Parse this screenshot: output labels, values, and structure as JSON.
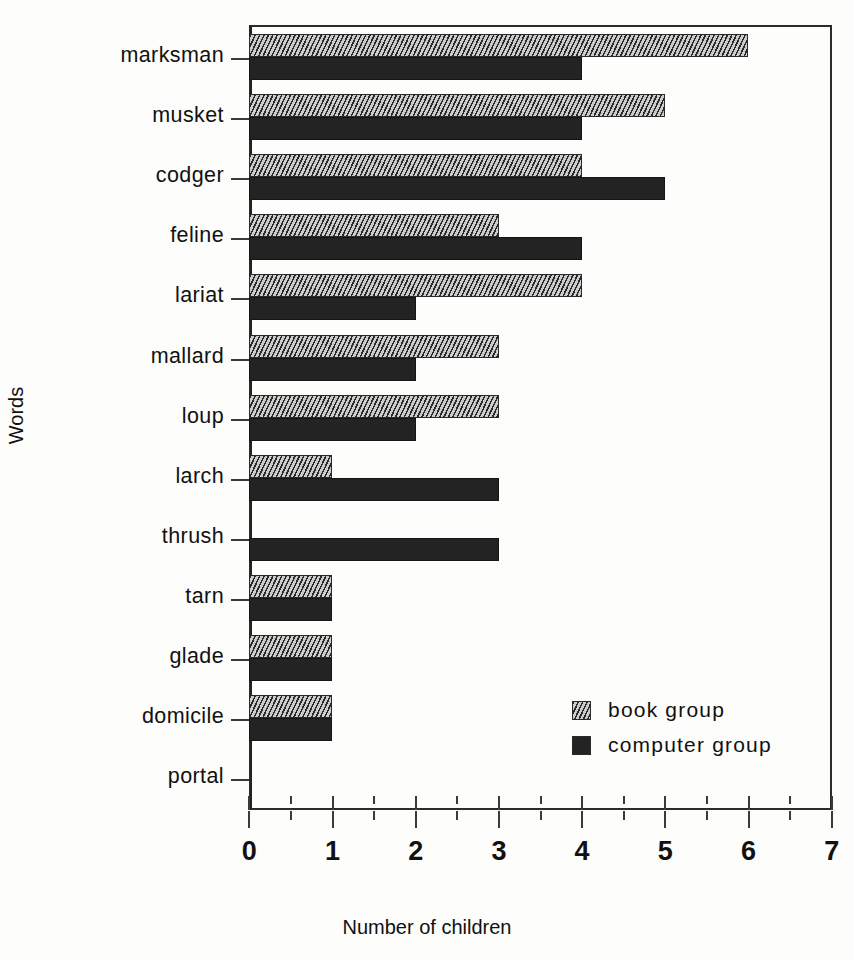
{
  "chart_data": {
    "type": "bar",
    "orientation": "horizontal",
    "title": "",
    "xlabel": "Number of children",
    "ylabel": "Words",
    "xlim": [
      0,
      7
    ],
    "xticks": [
      0,
      1,
      2,
      3,
      4,
      5,
      6,
      7
    ],
    "xticklabels": [
      "0",
      "1",
      "2",
      "3",
      "4",
      "5",
      "6",
      "7"
    ],
    "minor_ticks": [
      0.5,
      1.5,
      2.5,
      3.5,
      4.5,
      5.5,
      6.5
    ],
    "grid": false,
    "legend_position": "lower right",
    "categories": [
      "marksman",
      "musket",
      "codger",
      "feline",
      "lariat",
      "mallard",
      "loup",
      "larch",
      "thrush",
      "tarn",
      "glade",
      "domicile",
      "portal"
    ],
    "series": [
      {
        "name": "book group",
        "style": "hatched",
        "color": "#8e8e8e",
        "values": [
          6,
          5,
          4,
          3,
          4,
          3,
          3,
          1,
          0,
          1,
          1,
          1,
          0
        ]
      },
      {
        "name": "computer group",
        "style": "solid",
        "color": "#232323",
        "values": [
          4,
          4,
          5,
          4,
          2,
          2,
          2,
          3,
          3,
          1,
          1,
          1,
          0
        ]
      }
    ]
  },
  "legend": {
    "entries": [
      {
        "label": "book group",
        "swatch": "hatched-swatch-icon"
      },
      {
        "label": "computer group",
        "swatch": "solid-swatch-icon"
      }
    ]
  },
  "axes": {
    "x_title": "Number of children",
    "y_title": "Words"
  }
}
